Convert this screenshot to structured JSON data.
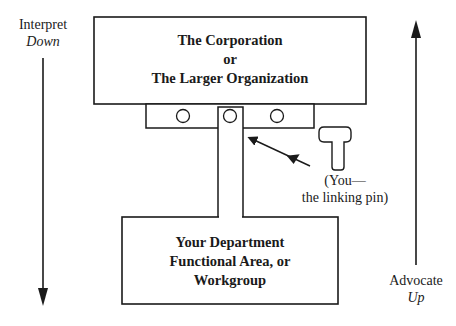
{
  "diagram": {
    "top_box": {
      "line1": "The Corporation",
      "line2": "or",
      "line3": "The Larger Organization"
    },
    "bottom_box": {
      "line1": "Your Department",
      "line2": "Functional Area, or",
      "line3": "Workgroup"
    },
    "left_label": {
      "line1": "Interpret",
      "line2": "Down"
    },
    "right_label": {
      "line1": "Advocate",
      "line2": "Up"
    },
    "pin_label": {
      "line1": "(You—",
      "line2": "the linking pin)"
    },
    "colors": {
      "stroke": "#1a1a1a",
      "background": "#ffffff"
    }
  }
}
